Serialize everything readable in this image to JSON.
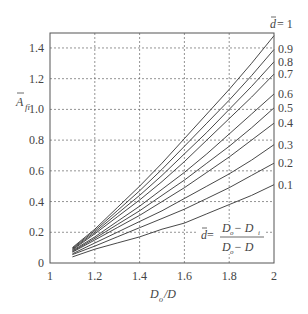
{
  "chart_data": {
    "type": "line",
    "title": "",
    "xlabel": "D_o / D",
    "ylabel": "A_fi (bar)",
    "xlim": [
      1,
      2
    ],
    "ylim": [
      0,
      1.5
    ],
    "grid": true,
    "x_ticks": [
      "1",
      "1.2",
      "1.4",
      "1.6",
      "1.8",
      "2"
    ],
    "y_ticks": [
      "0",
      "0.2",
      "0.4",
      "0.6",
      "0.8",
      "1.0",
      "1.2",
      "1.4"
    ],
    "legend_position": "right-edge curve labels",
    "annotation": "d̄ = (D_o − D_i) / (D_o − D)",
    "x": [
      1.1,
      1.2,
      1.3,
      1.4,
      1.5,
      1.6,
      1.7,
      1.8,
      1.9,
      2.0
    ],
    "series": [
      {
        "name": "d̄ = 1",
        "label": "d̄ = 1",
        "values": [
          0.1,
          0.22,
          0.36,
          0.5,
          0.65,
          0.81,
          0.97,
          1.13,
          1.3,
          1.48
        ]
      },
      {
        "name": "0.9",
        "label": "0.9",
        "values": [
          0.095,
          0.21,
          0.34,
          0.47,
          0.61,
          0.76,
          0.91,
          1.06,
          1.22,
          1.39
        ]
      },
      {
        "name": "0.8",
        "label": "0.8",
        "values": [
          0.09,
          0.2,
          0.32,
          0.44,
          0.57,
          0.71,
          0.85,
          1.0,
          1.15,
          1.31
        ]
      },
      {
        "name": "0.7",
        "label": "0.7",
        "values": [
          0.085,
          0.19,
          0.3,
          0.41,
          0.53,
          0.66,
          0.8,
          0.94,
          1.08,
          1.23
        ]
      },
      {
        "name": "0.6",
        "label": "0.6",
        "values": [
          0.08,
          0.17,
          0.27,
          0.37,
          0.48,
          0.59,
          0.71,
          0.84,
          0.97,
          1.1
        ]
      },
      {
        "name": "0.5",
        "label": "0.5",
        "values": [
          0.075,
          0.16,
          0.25,
          0.34,
          0.44,
          0.54,
          0.65,
          0.76,
          0.88,
          1.01
        ]
      },
      {
        "name": "0.4",
        "label": "0.4",
        "values": [
          0.07,
          0.15,
          0.23,
          0.31,
          0.4,
          0.49,
          0.59,
          0.69,
          0.8,
          0.91
        ]
      },
      {
        "name": "0.3",
        "label": "0.3",
        "values": [
          0.06,
          0.13,
          0.2,
          0.27,
          0.34,
          0.42,
          0.5,
          0.58,
          0.67,
          0.77
        ]
      },
      {
        "name": "0.2",
        "label": "0.2",
        "values": [
          0.055,
          0.11,
          0.17,
          0.23,
          0.29,
          0.35,
          0.42,
          0.49,
          0.57,
          0.65
        ]
      },
      {
        "name": "0.1",
        "label": "0.1",
        "values": [
          0.04,
          0.09,
          0.13,
          0.17,
          0.22,
          0.26,
          0.32,
          0.38,
          0.44,
          0.51
        ]
      }
    ]
  },
  "labels": {
    "ylabel_main": "A",
    "ylabel_sub": "fi",
    "xlabel_main": "D",
    "xlabel_sub": "o",
    "xlabel_rest": " /D",
    "legend_d": "d",
    "legend_eq1": " = 1",
    "annot_d": "d",
    "annot_eq": " = ",
    "annot_num": "D  − D",
    "annot_den": "D  − D"
  }
}
